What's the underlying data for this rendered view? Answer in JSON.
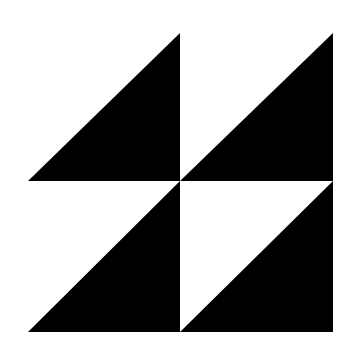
{
  "figure": {
    "title": "Half-square triangle block pattern",
    "background_color": "#ffffff",
    "fill_color": "#000000",
    "grid": {
      "rows": 2,
      "cols": 2
    },
    "bounds": {
      "x0": 28,
      "y0": 33,
      "x1": 333,
      "y1": 332,
      "cx": 180,
      "cy": 181
    },
    "cells": [
      {
        "name": "top-left",
        "filled_half": "lower-right"
      },
      {
        "name": "top-right",
        "filled_half": "lower-right"
      },
      {
        "name": "bottom-left",
        "filled_half": "lower-right"
      },
      {
        "name": "bottom-right",
        "filled_half": "lower-right"
      }
    ]
  }
}
